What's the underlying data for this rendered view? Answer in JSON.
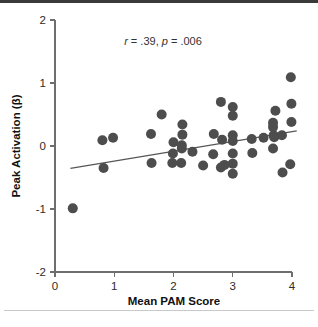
{
  "chart_data": {
    "type": "scatter",
    "title": "",
    "xlabel": "Mean PAM Score",
    "ylabel": "Peak Activation (β)",
    "xlim": [
      0,
      4
    ],
    "ylim": [
      -2,
      2
    ],
    "xticks": [
      "0",
      "1",
      "2",
      "3",
      "4"
    ],
    "xtick_values": [
      0,
      1,
      2,
      3,
      4
    ],
    "yticks": [
      "2",
      "1",
      "0",
      "-1",
      "-2"
    ],
    "ytick_values": [
      2,
      1,
      0,
      -1,
      -2
    ],
    "grid": false,
    "legend": null,
    "annotation": {
      "r_label": "r",
      "r_value": " = .39, ",
      "p_label": "p",
      "p_value": " = .006",
      "full_text": "r = .39, p = .006"
    },
    "marker": {
      "shape": "circle",
      "color": "#4d4d4d",
      "radius_px": 5.0
    },
    "fit_line": {
      "color": "#565656",
      "x_start": 0.26,
      "y_start": -0.355,
      "x_end": 4.08,
      "y_end": 0.24
    },
    "points": [
      {
        "x": 0.3,
        "y": -0.99
      },
      {
        "x": 0.8,
        "y": 0.09
      },
      {
        "x": 0.98,
        "y": 0.13
      },
      {
        "x": 0.82,
        "y": -0.35
      },
      {
        "x": 1.62,
        "y": 0.19
      },
      {
        "x": 1.63,
        "y": -0.27
      },
      {
        "x": 1.8,
        "y": 0.5
      },
      {
        "x": 2.0,
        "y": 0.06
      },
      {
        "x": 1.99,
        "y": -0.12
      },
      {
        "x": 1.98,
        "y": -0.27
      },
      {
        "x": 2.15,
        "y": 0.34
      },
      {
        "x": 2.15,
        "y": 0.18
      },
      {
        "x": 2.14,
        "y": 0.01
      },
      {
        "x": 2.14,
        "y": -0.04
      },
      {
        "x": 2.13,
        "y": -0.27
      },
      {
        "x": 2.32,
        "y": -0.09
      },
      {
        "x": 2.5,
        "y": -0.31
      },
      {
        "x": 2.68,
        "y": 0.19
      },
      {
        "x": 2.67,
        "y": -0.13
      },
      {
        "x": 2.8,
        "y": 0.7
      },
      {
        "x": 2.82,
        "y": 0.1
      },
      {
        "x": 2.8,
        "y": -0.34
      },
      {
        "x": 2.86,
        "y": -0.3
      },
      {
        "x": 3.0,
        "y": 0.62
      },
      {
        "x": 3.0,
        "y": 0.48
      },
      {
        "x": 3.0,
        "y": 0.17
      },
      {
        "x": 3.0,
        "y": 0.08
      },
      {
        "x": 3.0,
        "y": -0.12
      },
      {
        "x": 3.0,
        "y": -0.28
      },
      {
        "x": 3.0,
        "y": -0.44
      },
      {
        "x": 3.32,
        "y": 0.11
      },
      {
        "x": 3.33,
        "y": -0.11
      },
      {
        "x": 3.52,
        "y": 0.13
      },
      {
        "x": 3.68,
        "y": 0.37
      },
      {
        "x": 3.68,
        "y": 0.3
      },
      {
        "x": 3.69,
        "y": 0.17
      },
      {
        "x": 3.7,
        "y": 0.14
      },
      {
        "x": 3.68,
        "y": -0.04
      },
      {
        "x": 3.72,
        "y": 0.56
      },
      {
        "x": 3.83,
        "y": 0.17
      },
      {
        "x": 3.84,
        "y": -0.42
      },
      {
        "x": 3.98,
        "y": 1.09
      },
      {
        "x": 3.99,
        "y": 0.67
      },
      {
        "x": 3.99,
        "y": 0.38
      },
      {
        "x": 3.97,
        "y": -0.29
      }
    ]
  },
  "figure": {
    "background_color": "#ffffff",
    "top_rule_color": "#3a3a3a",
    "bottom_rule_color": "#c9c9c9",
    "axis_color": "#6e6e6e"
  }
}
